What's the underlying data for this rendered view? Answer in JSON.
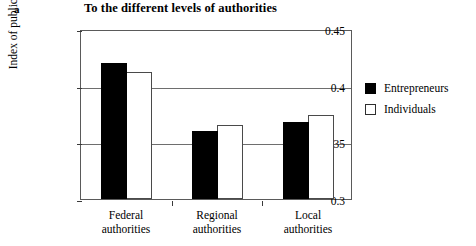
{
  "panel": {
    "letter": "a"
  },
  "chart_data": {
    "type": "bar",
    "title": "To the different levels of authorities",
    "xlabel": "",
    "ylabel": "Index of public trust",
    "ylim": [
      0.3,
      0.45
    ],
    "yticks": [
      "0.3",
      "0.35",
      "0.4",
      "0.45"
    ],
    "ytick_values": [
      0.3,
      0.35,
      0.4,
      0.45
    ],
    "grid": true,
    "legend_position": "right",
    "categories": [
      "Federal authorities",
      "Regional authorities",
      "Local authorities"
    ],
    "category_lines": [
      [
        "Federal",
        "authorities"
      ],
      [
        "Regional",
        "authorities"
      ],
      [
        "Local",
        "authorities"
      ]
    ],
    "series": [
      {
        "name": "Entrepreneurs",
        "color": "#000000",
        "values": [
          0.42,
          0.36,
          0.368
        ]
      },
      {
        "name": "Individuals",
        "color": "#ffffff",
        "values": [
          0.412,
          0.365,
          0.374
        ]
      }
    ]
  },
  "legend": {
    "items": [
      {
        "label": "Entrepreneurs",
        "style": "filled"
      },
      {
        "label": "Individuals",
        "style": "hollow"
      }
    ]
  }
}
